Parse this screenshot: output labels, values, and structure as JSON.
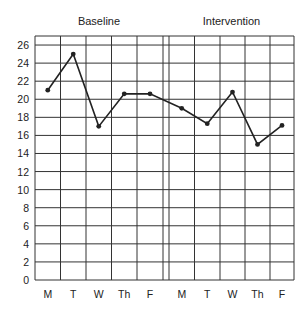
{
  "chart_data": {
    "type": "line",
    "title": "",
    "xlabel": "",
    "ylabel": "",
    "phases": [
      {
        "name": "Baseline",
        "categories": [
          "M",
          "T",
          "W",
          "Th",
          "F"
        ],
        "values": [
          21,
          25,
          17,
          20.6,
          20.6
        ]
      },
      {
        "name": "Intervention",
        "categories": [
          "M",
          "T",
          "W",
          "Th",
          "F"
        ],
        "values": [
          19,
          17.3,
          20.8,
          15,
          17.1
        ]
      }
    ],
    "categories": [
      "M",
      "T",
      "W",
      "Th",
      "F",
      "M",
      "T",
      "W",
      "Th",
      "F"
    ],
    "series": [
      {
        "name": "Score",
        "values": [
          21,
          25,
          17,
          20.6,
          20.6,
          19,
          17.3,
          20.8,
          15,
          17.1
        ]
      }
    ],
    "yticks": [
      0,
      2,
      4,
      6,
      8,
      10,
      12,
      14,
      16,
      18,
      20,
      22,
      24,
      26
    ],
    "ylim": [
      0,
      27
    ],
    "grid": true,
    "phase_divider": "double vertical line between baseline F and intervention M",
    "colors": {
      "line": "#222222",
      "grid": "#333333",
      "background": "#ffffff"
    }
  }
}
